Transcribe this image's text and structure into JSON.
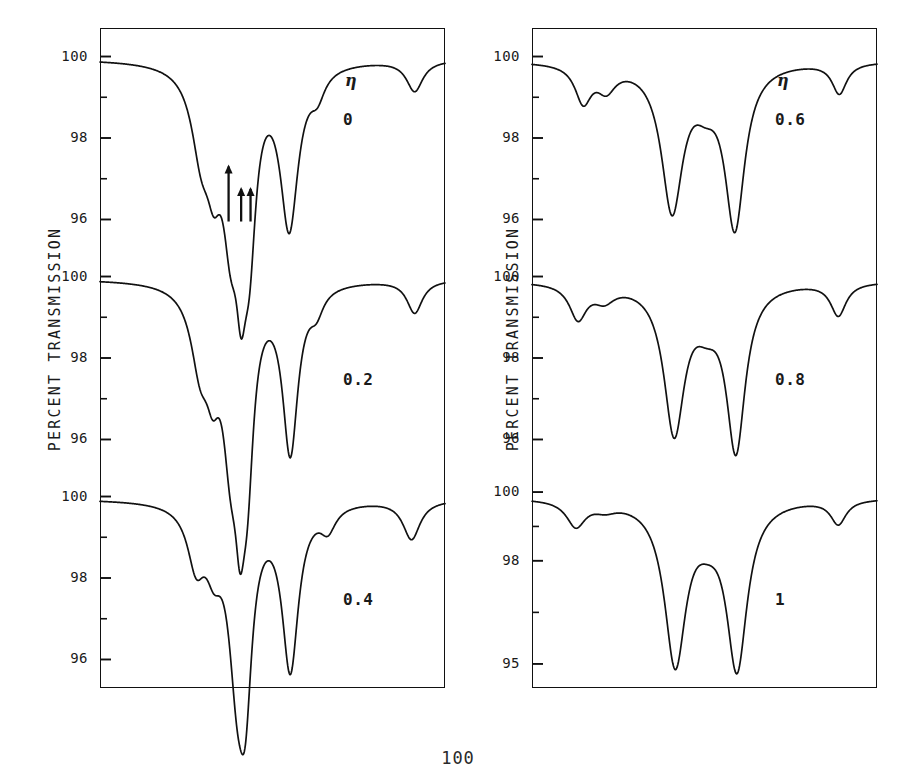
{
  "figure": {
    "page_number": "100",
    "axis": {
      "ylabel": "PERCENT TRANSMISSION",
      "xlabel": "VELOCITY (MM/SEC)",
      "xticks": [
        "-15",
        "-7.5",
        "0",
        "+7.5",
        "+15"
      ],
      "xtick_values": [
        -15,
        -7.5,
        0,
        7.5,
        15
      ],
      "eta_symbol": "η"
    }
  },
  "chart_data": {
    "type": "line",
    "title": "",
    "xlabel": "VELOCITY (MM/SEC)",
    "ylabel": "PERCENT TRANSMISSION",
    "xlim": [
      -16.5,
      16.5
    ],
    "grid": false,
    "legend": "none",
    "panels": [
      {
        "id": "panel-eta-0",
        "column": "left",
        "row": 0,
        "eta_symbol": "η",
        "eta_label": "0",
        "eta_value": 0,
        "yticks": [
          100,
          98,
          96
        ],
        "ylim": [
          95.3,
          100.7
        ],
        "baseline": 99.95,
        "absorption_lines": [
          {
            "center": -6.8,
            "depth": 1.85,
            "width": 1.15,
            "label": "line-1"
          },
          {
            "center": -5.6,
            "depth": 1.75,
            "width": 0.85,
            "label": "line-2"
          },
          {
            "center": -4.0,
            "depth": 3.2,
            "width": 0.95,
            "label": "line-3-arrow"
          },
          {
            "center": -3.0,
            "depth": 3.15,
            "width": 0.62,
            "label": "line-4-arrow"
          },
          {
            "center": -2.2,
            "depth": 3.45,
            "width": 0.78,
            "label": "line-5-arrow"
          },
          {
            "center": 1.6,
            "depth": 3.9,
            "width": 1.05,
            "label": "line-6"
          },
          {
            "center": 4.3,
            "depth": 0.55,
            "width": 0.85,
            "label": "line-7"
          },
          {
            "center": 13.6,
            "depth": 0.75,
            "width": 0.95,
            "label": "line-8"
          }
        ],
        "arrows": [
          {
            "x": -4.2,
            "height": "tall",
            "label": "arrow-left"
          },
          {
            "x": -3.0,
            "height": "short",
            "label": "arrow-middle"
          },
          {
            "x": -2.1,
            "height": "short",
            "label": "arrow-right"
          }
        ]
      },
      {
        "id": "panel-eta-0.2",
        "column": "left",
        "row": 1,
        "eta_symbol": "",
        "eta_label": "0.2",
        "eta_value": 0.2,
        "yticks": [
          100,
          98,
          96
        ],
        "ylim": [
          95.3,
          100.7
        ],
        "baseline": 99.95,
        "absorption_lines": [
          {
            "center": -6.9,
            "depth": 1.75,
            "width": 1.1,
            "label": "line-1"
          },
          {
            "center": -5.7,
            "depth": 1.5,
            "width": 0.8,
            "label": "line-2"
          },
          {
            "center": -4.0,
            "depth": 3.3,
            "width": 0.95,
            "label": "line-3"
          },
          {
            "center": -3.1,
            "depth": 3.2,
            "width": 0.6,
            "label": "line-4"
          },
          {
            "center": -2.4,
            "depth": 3.55,
            "width": 0.75,
            "label": "line-5"
          },
          {
            "center": 1.7,
            "depth": 4.05,
            "width": 0.9,
            "label": "line-6"
          },
          {
            "center": 4.2,
            "depth": 0.5,
            "width": 0.8,
            "label": "line-7"
          },
          {
            "center": 13.6,
            "depth": 0.8,
            "width": 0.9,
            "label": "line-8"
          }
        ],
        "arrows": []
      },
      {
        "id": "panel-eta-0.4",
        "column": "left",
        "row": 2,
        "eta_symbol": "",
        "eta_label": "0.4",
        "eta_value": 0.4,
        "yticks": [
          100,
          98,
          96
        ],
        "ylim": [
          95.3,
          100.7
        ],
        "baseline": 99.95,
        "absorption_lines": [
          {
            "center": -7.3,
            "depth": 1.35,
            "width": 1.0,
            "label": "line-1"
          },
          {
            "center": -5.6,
            "depth": 1.1,
            "width": 0.95,
            "label": "line-2"
          },
          {
            "center": -3.4,
            "depth": 3.45,
            "width": 1.0,
            "label": "line-3"
          },
          {
            "center": -2.6,
            "depth": 3.6,
            "width": 0.8,
            "label": "line-4"
          },
          {
            "center": 1.7,
            "depth": 4.0,
            "width": 0.95,
            "label": "line-5"
          },
          {
            "center": 5.3,
            "depth": 0.55,
            "width": 0.9,
            "label": "line-6"
          },
          {
            "center": 13.3,
            "depth": 0.95,
            "width": 1.0,
            "label": "line-7"
          }
        ],
        "arrows": []
      },
      {
        "id": "panel-eta-0.6",
        "column": "right",
        "row": 0,
        "eta_symbol": "η",
        "eta_label": "0.6",
        "eta_value": 0.6,
        "yticks": [
          100,
          98,
          96
        ],
        "ylim": [
          95.3,
          100.7
        ],
        "baseline": 99.9,
        "absorption_lines": [
          {
            "center": -11.6,
            "depth": 0.9,
            "width": 0.95,
            "label": "line-1"
          },
          {
            "center": -9.4,
            "depth": 0.55,
            "width": 1.1,
            "label": "line-2"
          },
          {
            "center": -3.1,
            "depth": 3.55,
            "width": 1.25,
            "label": "line-3"
          },
          {
            "center": 0.1,
            "depth": 0.6,
            "width": 1.35,
            "label": "line-4"
          },
          {
            "center": 2.9,
            "depth": 3.95,
            "width": 1.15,
            "label": "line-5"
          },
          {
            "center": 12.9,
            "depth": 0.75,
            "width": 0.85,
            "label": "line-6"
          }
        ],
        "arrows": []
      },
      {
        "id": "panel-eta-0.8",
        "column": "right",
        "row": 1,
        "eta_symbol": "",
        "eta_label": "0.8",
        "eta_value": 0.8,
        "yticks": [
          100,
          98,
          96
        ],
        "ylim": [
          95.3,
          100.7
        ],
        "baseline": 99.9,
        "absorption_lines": [
          {
            "center": -12.1,
            "depth": 0.85,
            "width": 1.0,
            "label": "line-1"
          },
          {
            "center": -9.6,
            "depth": 0.35,
            "width": 1.2,
            "label": "line-2"
          },
          {
            "center": -2.9,
            "depth": 3.6,
            "width": 1.2,
            "label": "line-3"
          },
          {
            "center": 0.2,
            "depth": 0.65,
            "width": 1.45,
            "label": "line-4"
          },
          {
            "center": 3.0,
            "depth": 4.0,
            "width": 1.1,
            "label": "line-5"
          },
          {
            "center": 12.8,
            "depth": 0.8,
            "width": 0.9,
            "label": "line-6"
          }
        ],
        "arrows": []
      },
      {
        "id": "panel-eta-1",
        "column": "right",
        "row": 2,
        "eta_symbol": "",
        "eta_label": "1",
        "eta_value": 1,
        "yticks": [
          100,
          98,
          95
        ],
        "ylim": [
          94.3,
          100.7
        ],
        "baseline": 99.85,
        "absorption_lines": [
          {
            "center": -12.3,
            "depth": 0.75,
            "width": 1.1,
            "label": "line-1"
          },
          {
            "center": -9.5,
            "depth": 0.2,
            "width": 1.3,
            "label": "line-2"
          },
          {
            "center": -2.8,
            "depth": 4.7,
            "width": 1.25,
            "label": "line-3"
          },
          {
            "center": 0.3,
            "depth": 0.55,
            "width": 1.5,
            "label": "line-4"
          },
          {
            "center": 3.1,
            "depth": 4.8,
            "width": 1.2,
            "label": "line-5"
          },
          {
            "center": 12.8,
            "depth": 0.7,
            "width": 0.9,
            "label": "line-6"
          }
        ],
        "arrows": []
      }
    ]
  }
}
